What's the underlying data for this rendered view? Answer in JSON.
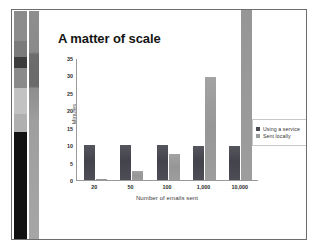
{
  "slide": {
    "title": "A matter of scale"
  },
  "decoration": {
    "strip_segments": [
      {
        "name": "photo-segment-gray-top",
        "color": "#8c8c8c",
        "height_pct": 13
      },
      {
        "name": "photo-segment-mid-gray",
        "color": "#7b7b7b",
        "height_pct": 7
      },
      {
        "name": "photo-segment-dark",
        "color": "#3c3c3c",
        "height_pct": 5
      },
      {
        "name": "photo-segment-gray",
        "color": "#8a8a8a",
        "height_pct": 9
      },
      {
        "name": "photo-segment-light-lines",
        "color": "#c2c2c2",
        "height_pct": 11
      },
      {
        "name": "photo-segment-pale",
        "color": "#b0b0b0",
        "height_pct": 8
      },
      {
        "name": "photo-segment-black",
        "color": "#111111",
        "height_pct": 47
      }
    ],
    "band_color": "#9a9a9a"
  },
  "chart_data": {
    "type": "bar",
    "title": "A matter of scale",
    "xlabel": "Number of emails sent",
    "ylabel": "Minutes",
    "categories": [
      "20",
      "50",
      "100",
      "1,000",
      "10,000"
    ],
    "series": [
      {
        "name": "Using a service",
        "color": "#4a4a52",
        "values": [
          10,
          10,
          10,
          9.8,
          9.7
        ]
      },
      {
        "name": "Sent locally",
        "color": "#9a9a9a",
        "values": [
          0.4,
          2.6,
          7.6,
          29.5,
          96
        ]
      }
    ],
    "ylim": [
      0,
      35
    ],
    "yticks": [
      0,
      5,
      10,
      15,
      20,
      25,
      30,
      35
    ],
    "grid": false,
    "legend_position": "right"
  }
}
